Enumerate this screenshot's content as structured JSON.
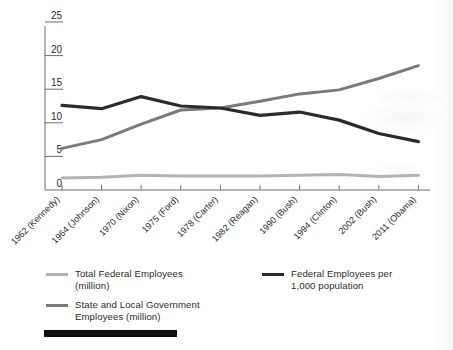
{
  "chart_data": {
    "type": "line",
    "title": "",
    "subtitle": "",
    "xlabel": "",
    "ylabel": "",
    "ylim": [
      0,
      25
    ],
    "yticks": [
      0,
      5,
      10,
      15,
      20,
      25
    ],
    "grid": false,
    "legend_position": "bottom",
    "categories": [
      "1962 (Kennedy)",
      "1964 (Johnson)",
      "1970 (Nixon)",
      "1975 (Ford)",
      "1978 (Carter)",
      "1982 (Reagan)",
      "1990 (Bush)",
      "1994 (Clinton)",
      "2002 (Bush)",
      "2011 (Obama)"
    ],
    "series": [
      {
        "name": "Total Federal Employees (million)",
        "color": "#b3b3b3",
        "values": [
          1.8,
          1.9,
          2.2,
          2.1,
          2.1,
          2.1,
          2.2,
          2.3,
          2.0,
          2.2
        ]
      },
      {
        "name": "State and Local Government Employees (million)",
        "color": "#7a7a7a",
        "values": [
          6.2,
          7.5,
          9.8,
          11.9,
          12.2,
          13.2,
          14.3,
          14.9,
          16.6,
          18.5
        ]
      },
      {
        "name": "Federal Employees per 1,000 population",
        "color": "#2b2b2b",
        "values": [
          12.6,
          12.1,
          13.9,
          12.5,
          12.2,
          11.1,
          11.6,
          10.4,
          8.4,
          7.2
        ]
      }
    ]
  },
  "axis": {
    "y_tick_labels": [
      "25",
      "20",
      "15",
      "10",
      "5",
      "0"
    ],
    "x_tick_labels": [
      "1962 (Kennedy)",
      "1964 (Johnson)",
      "1970 (Nixon)",
      "1975 (Ford)",
      "1978 (Carter)",
      "1982 (Reagan)",
      "1990 (Bush)",
      "1994 (Clinton)",
      "2002 (Bush)",
      "2011 (Obama)"
    ]
  },
  "legend": {
    "items": [
      {
        "label_line1": "Total Federal Employees",
        "label_line2": "(million)",
        "color": "#b3b3b3",
        "swatch_name": "legend-swatch-total-federal-employees"
      },
      {
        "label_line1": "Federal Employees per",
        "label_line2": "1,000 population",
        "color": "#2b2b2b",
        "swatch_name": "legend-swatch-federal-employees-per-1000"
      },
      {
        "label_line1": "State and Local Government",
        "label_line2": "Employees (million)",
        "color": "#7a7a7a",
        "swatch_name": "legend-swatch-state-local-government"
      }
    ]
  },
  "colors": {
    "series_light_gray": "#b3b3b3",
    "series_mid_gray": "#7a7a7a",
    "series_dark": "#2b2b2b",
    "axis": "#6e6e6e",
    "background": "#ffffff",
    "footer_bar": "#111111"
  }
}
